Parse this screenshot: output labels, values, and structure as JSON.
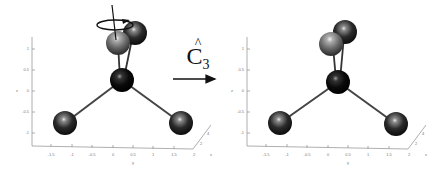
{
  "figure": {
    "operation": {
      "symbol": "C",
      "subscript": "3",
      "hat": "^",
      "meaning": "C3 rotation operator"
    },
    "panels": [
      {
        "id": "before",
        "z_axis_label": "z",
        "y_axis_label": "y",
        "x_axis_label": "x",
        "z_ticks": [
          "1",
          "0.5",
          "0",
          "-0.5",
          "-1"
        ],
        "y_ticks": [
          "-1.5",
          "-1",
          "-0.5",
          "0",
          "0.5",
          "1",
          "1.5",
          "2"
        ],
        "x_ticks": [
          "2",
          "4"
        ],
        "rotation_indicator": true
      },
      {
        "id": "after",
        "z_axis_label": "z",
        "y_axis_label": "y",
        "x_axis_label": "x",
        "z_ticks": [
          "1",
          "0.5",
          "0",
          "-0.5",
          "-1"
        ],
        "y_ticks": [
          "-1.5",
          "-1",
          "-0.5",
          "0",
          "0.5",
          "1",
          "1.5",
          "2"
        ],
        "x_ticks": [
          "2",
          "4"
        ],
        "rotation_indicator": false
      }
    ],
    "colors": {
      "central_atom": "#0a0a0a",
      "outer_atom_dark": "#2a2a2a",
      "outer_atom_light": "#7a7a7a",
      "bond": "#444444",
      "axis": "#9a9a9a",
      "arrow": "#111111"
    }
  }
}
